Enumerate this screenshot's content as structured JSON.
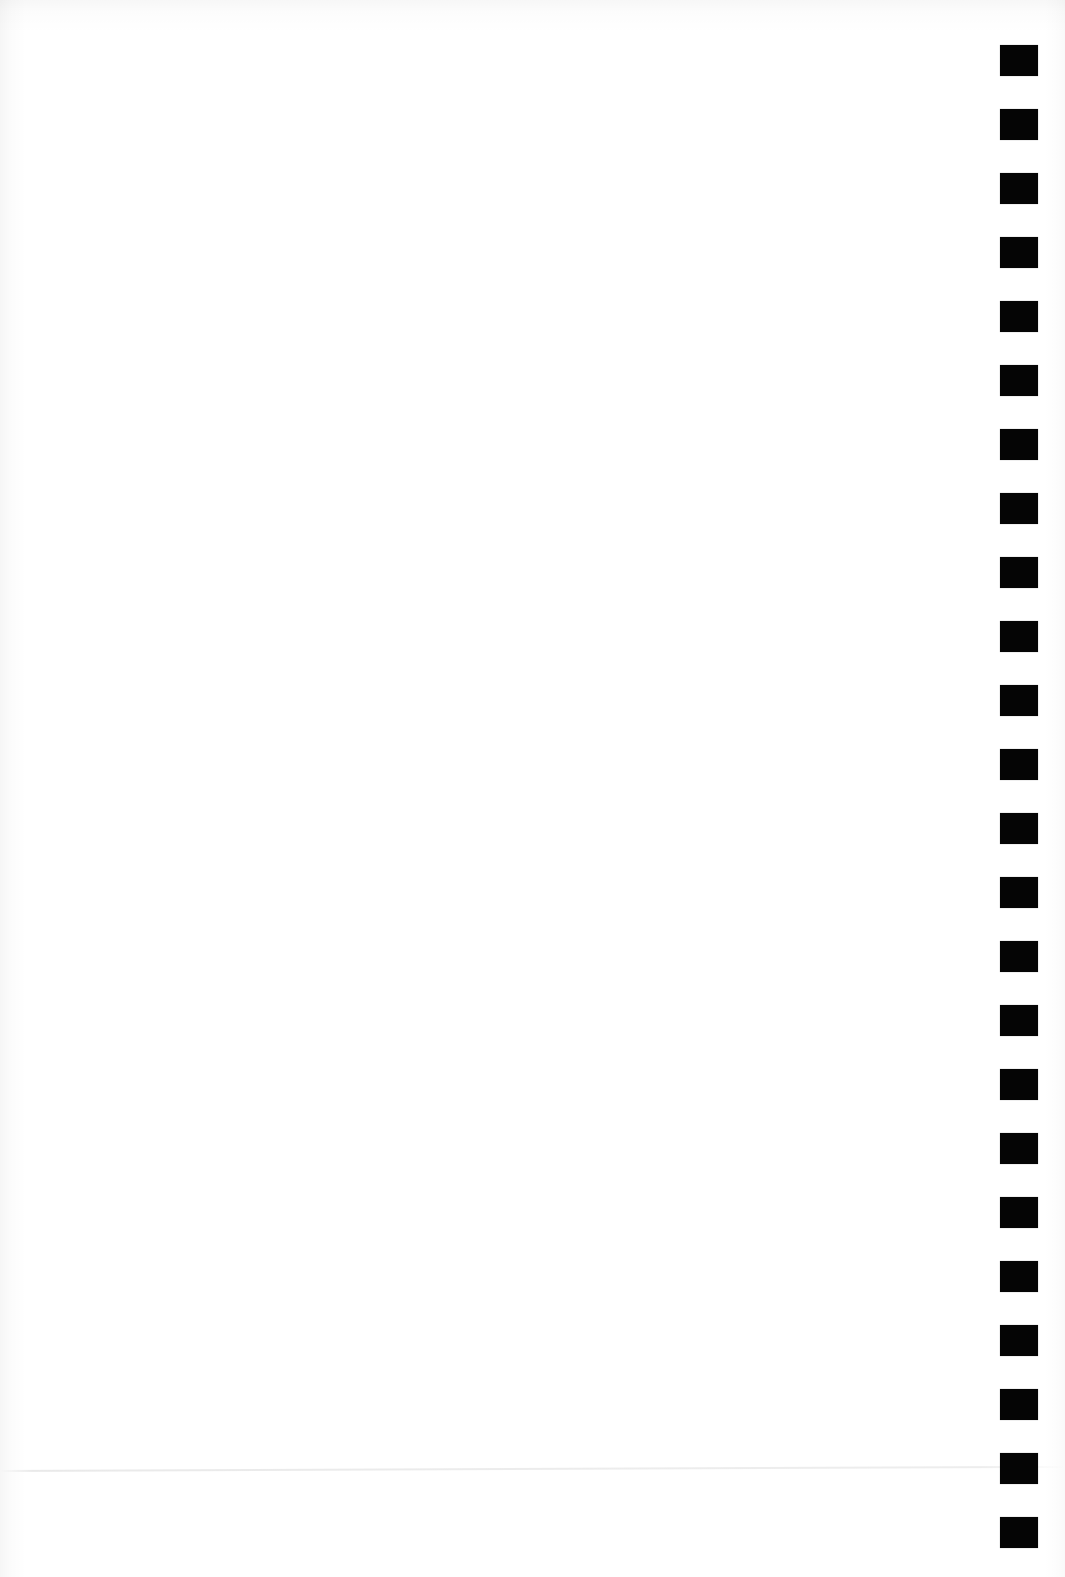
{
  "document": {
    "title": "Scanned Blank Page",
    "page_number": "",
    "body_text": "",
    "page_width_px": 1065,
    "page_height_px": 1577,
    "background_color": "#ffffff"
  },
  "registration_marks": {
    "label": "registration-mark-column",
    "count": 24,
    "color": "#050505",
    "mark_width_px": 38,
    "mark_height_px": 31,
    "left_px": 1000,
    "first_top_px": 45,
    "pitch_px": 64.0
  },
  "artifacts": {
    "faint_rule": {
      "label": "faint-horizontal-rule",
      "color": "#e9e9e9",
      "top_px": 1470,
      "rotation_deg": -0.22
    },
    "scan_edge_top": {
      "label": "scan-edge-shadow-top",
      "color": "#f7f7f7"
    },
    "scan_edge_left": {
      "label": "scan-edge-shadow-left",
      "color": "#f6f6f6"
    },
    "scan_edge_right": {
      "label": "scan-edge-shadow-right",
      "color": "#fafafa"
    }
  }
}
